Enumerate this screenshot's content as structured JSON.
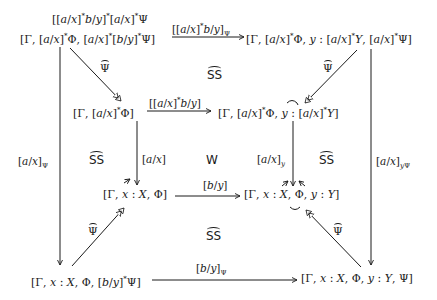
{
  "diagram": {
    "type": "commutative-diagram",
    "nodes": {
      "top_left_line1": "[[a/x]*b/y]*[a/x]*Ψ",
      "top_left_line2": "[Γ, [a/x]*Φ, [a/x]*[b/y]*Ψ]",
      "top_right": "[Γ, [a/x]*Φ, y : [a/x]*Y, [a/x]*Ψ]",
      "mid_left": "[Γ, [a/x]*Φ]",
      "mid_right": "[Γ, [a/x]*Φ, y : [a/x]*Y]",
      "inner_left": "[Γ, x : X, Φ]",
      "inner_right": "[Γ, x : X, Φ, y : Y]",
      "bottom_left": "[Γ, x : X, Φ, [b/y]*Ψ]",
      "bottom_right": "[Γ, x : X, Φ, y : Y, Ψ]"
    },
    "arrows": [
      {
        "from": "top_left",
        "to": "top_right",
        "label": "[[a/x]*b/y]_Ψ",
        "head": "solid"
      },
      {
        "from": "top_left",
        "to": "mid_left",
        "label": "Ψ̂",
        "head": "open"
      },
      {
        "from": "top_right",
        "to": "mid_right",
        "label": "Ψ̂",
        "head": "open"
      },
      {
        "from": "mid_left",
        "to": "mid_right",
        "label": "[[a/x]*b/y]",
        "head": "solid"
      },
      {
        "from": "top_left",
        "to": "bottom_left",
        "label": "[a/x]_Ψ",
        "head": "solid"
      },
      {
        "from": "top_right",
        "to": "bottom_right",
        "label": "[a/x]_yΨ",
        "head": "solid"
      },
      {
        "from": "mid_left",
        "to": "inner_left",
        "label": "[a/x]",
        "head": "solid"
      },
      {
        "from": "mid_right",
        "to": "inner_right",
        "label": "[a/x]_y",
        "head": "solid"
      },
      {
        "from": "inner_left",
        "to": "inner_right",
        "label": "[b/y]",
        "head": "solid"
      },
      {
        "from": "bottom_left",
        "to": "inner_left",
        "label": "Ψ̂",
        "head": "open"
      },
      {
        "from": "bottom_right",
        "to": "inner_right",
        "label": "Ψ̂",
        "head": "open"
      },
      {
        "from": "bottom_left",
        "to": "bottom_right",
        "label": "[b/y]_Ψ",
        "head": "solid"
      }
    ],
    "region_labels": {
      "top": "SS",
      "left": "SS",
      "center": "W",
      "right": "SS",
      "bottom": "SS"
    }
  }
}
